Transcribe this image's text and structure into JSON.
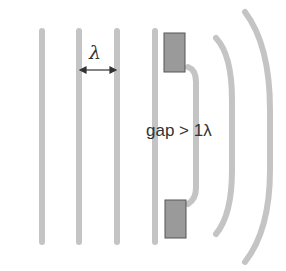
{
  "diagram": {
    "wavelength_label": "λ",
    "gap_label": "gap > 1λ",
    "colors": {
      "wavefront": "#c4c4c4",
      "barrier_fill": "#9a9a9a",
      "barrier_stroke": "#555555",
      "arrow": "#333333"
    }
  }
}
